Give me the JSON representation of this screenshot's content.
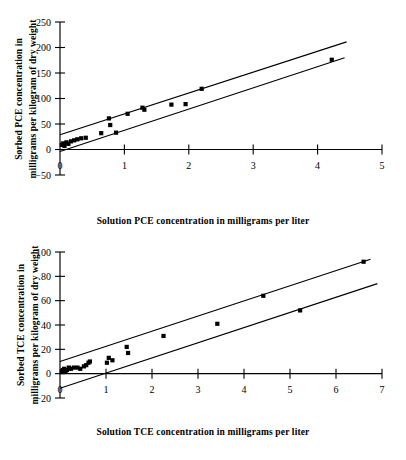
{
  "figure": {
    "charts": [
      {
        "id": "pce",
        "xlabel": "Solution PCE concentration in milligrams per liter",
        "ylabel_line1": "Sorbed PCE concentration in",
        "ylabel_line2": "milligrams per kilogram of dry weight",
        "xticks": [
          "0",
          "1",
          "2",
          "3",
          "4",
          "5"
        ],
        "yticks": [
          "250",
          "200",
          "150",
          "100",
          "50",
          "0",
          "−50"
        ]
      },
      {
        "id": "tce",
        "xlabel": "Solution TCE concentration in milligrams per liter",
        "ylabel_line1": "Sorbed TCE concentration in",
        "ylabel_line2": "milligrams per kilogram of dry weight",
        "xticks": [
          "0",
          "1",
          "2",
          "3",
          "4",
          "5",
          "6",
          "7"
        ],
        "yticks": [
          "100",
          "80",
          "60",
          "40",
          "20",
          "0",
          "−20"
        ]
      }
    ]
  },
  "chart_data": [
    {
      "type": "scatter",
      "id": "pce",
      "title": "",
      "xlabel": "Solution PCE concentration in milligrams per liter",
      "ylabel": "Sorbed PCE concentration in milligrams per kilogram of dry weight",
      "xlim": [
        0,
        5
      ],
      "ylim": [
        -50,
        250
      ],
      "xticks": [
        0,
        1,
        2,
        3,
        4,
        5
      ],
      "yticks": [
        -50,
        0,
        50,
        100,
        150,
        200,
        250
      ],
      "grid": false,
      "legend": false,
      "marker": "square",
      "points": [
        {
          "x": 0.03,
          "y": 9
        },
        {
          "x": 0.05,
          "y": 12
        },
        {
          "x": 0.07,
          "y": 7
        },
        {
          "x": 0.1,
          "y": 14
        },
        {
          "x": 0.13,
          "y": 11
        },
        {
          "x": 0.17,
          "y": 16
        },
        {
          "x": 0.22,
          "y": 18
        },
        {
          "x": 0.27,
          "y": 20
        },
        {
          "x": 0.33,
          "y": 22
        },
        {
          "x": 0.4,
          "y": 23
        },
        {
          "x": 0.64,
          "y": 32
        },
        {
          "x": 0.76,
          "y": 61
        },
        {
          "x": 0.78,
          "y": 48
        },
        {
          "x": 0.87,
          "y": 33
        },
        {
          "x": 1.05,
          "y": 70
        },
        {
          "x": 1.28,
          "y": 82
        },
        {
          "x": 1.31,
          "y": 78
        },
        {
          "x": 1.73,
          "y": 88
        },
        {
          "x": 1.95,
          "y": 89
        },
        {
          "x": 2.2,
          "y": 119
        },
        {
          "x": 4.22,
          "y": 176
        }
      ],
      "envelope_lines": [
        {
          "name": "upper-bound-line",
          "x0": 0.0,
          "y0": 29,
          "x1": 4.45,
          "y1": 211
        },
        {
          "name": "lower-bound-line",
          "x0": 0.0,
          "y0": -4,
          "x1": 4.42,
          "y1": 180
        }
      ]
    },
    {
      "type": "scatter",
      "id": "tce",
      "title": "",
      "xlabel": "Solution TCE concentration in milligrams per liter",
      "ylabel": "Sorbed TCE concentration in milligrams per kilogram of dry weight",
      "xlim": [
        0,
        7
      ],
      "ylim": [
        -20,
        100
      ],
      "xticks": [
        0,
        1,
        2,
        3,
        4,
        5,
        6,
        7
      ],
      "yticks": [
        -20,
        0,
        20,
        40,
        60,
        80,
        100
      ],
      "grid": false,
      "legend": false,
      "marker": "square",
      "points": [
        {
          "x": 0.04,
          "y": 2
        },
        {
          "x": 0.06,
          "y": 3
        },
        {
          "x": 0.09,
          "y": 4
        },
        {
          "x": 0.12,
          "y": 2
        },
        {
          "x": 0.15,
          "y": 3
        },
        {
          "x": 0.19,
          "y": 5
        },
        {
          "x": 0.24,
          "y": 4
        },
        {
          "x": 0.3,
          "y": 5
        },
        {
          "x": 0.38,
          "y": 5
        },
        {
          "x": 0.44,
          "y": 4
        },
        {
          "x": 0.52,
          "y": 6
        },
        {
          "x": 0.57,
          "y": 7
        },
        {
          "x": 0.62,
          "y": 9
        },
        {
          "x": 0.65,
          "y": 10
        },
        {
          "x": 1.02,
          "y": 9
        },
        {
          "x": 1.06,
          "y": 13
        },
        {
          "x": 1.14,
          "y": 11
        },
        {
          "x": 1.45,
          "y": 22
        },
        {
          "x": 1.48,
          "y": 17
        },
        {
          "x": 2.25,
          "y": 31
        },
        {
          "x": 3.42,
          "y": 41
        },
        {
          "x": 4.42,
          "y": 64
        },
        {
          "x": 5.22,
          "y": 52
        },
        {
          "x": 6.6,
          "y": 92
        }
      ],
      "envelope_lines": [
        {
          "name": "upper-bound-line",
          "x0": 0.0,
          "y0": 10,
          "x1": 6.75,
          "y1": 94
        },
        {
          "name": "lower-bound-line",
          "x0": 0.0,
          "y0": -12,
          "x1": 6.9,
          "y1": 74
        }
      ]
    }
  ]
}
